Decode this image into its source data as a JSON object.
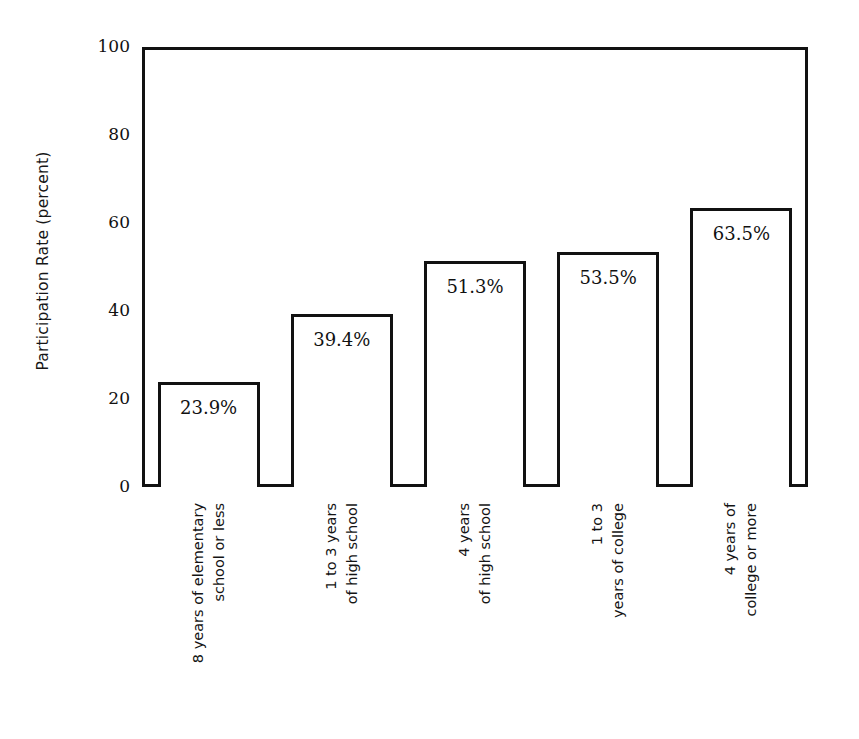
{
  "chart_data": {
    "type": "bar",
    "title": "",
    "xlabel": "",
    "ylabel": "Participation Rate (percent)",
    "ylim": [
      0,
      100
    ],
    "yticks": [
      0,
      20,
      40,
      60,
      80,
      100
    ],
    "ytick_labels": [
      "0",
      "20",
      "40",
      "60",
      "80",
      "100"
    ],
    "grid": "horizontal",
    "legend": "none",
    "bar_style": {
      "fill": "#ffffff",
      "edge": "#111111"
    },
    "categories": [
      "8 years of elementary school or less",
      "1 to 3 years of high school",
      "4 years of high school",
      "1 to 3 years of college",
      "4 years of college or more"
    ],
    "category_lines": [
      [
        "8 years of elementary",
        "school or less"
      ],
      [
        "1 to 3 years",
        "of high school"
      ],
      [
        "4 years",
        "of high school"
      ],
      [
        "1 to 3",
        "years of college"
      ],
      [
        "4 years of",
        "college or more"
      ]
    ],
    "values": [
      23.9,
      39.4,
      51.3,
      53.5,
      63.5
    ],
    "value_labels": [
      "23.9%",
      "39.4%",
      "51.3%",
      "53.5%",
      "63.5%"
    ]
  }
}
